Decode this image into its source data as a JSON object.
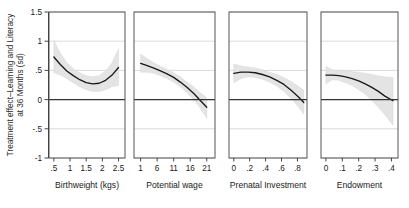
{
  "chart_data": {
    "type": "line",
    "title": "",
    "ylabel_line1": "Treatment effect–Learning and Literacy",
    "ylabel_line2": "at 36 Months (sd)",
    "ylim": [
      -1.0,
      1.5
    ],
    "yticks": [
      1.5,
      1,
      0.5,
      0,
      -0.5,
      -1
    ],
    "ytick_labels": [
      "1.5",
      "1",
      ".5",
      "0",
      "-.5",
      "-1"
    ],
    "grid": true,
    "legend": "none",
    "band_label": "95% confidence interval",
    "band_color": "#e3e3e3",
    "line_color": "#1a1a1a",
    "zero_line_color": "#333333",
    "panels": [
      {
        "xlabel": "Birthweight (kgs)",
        "xticks": [
          0.5,
          1,
          1.5,
          2,
          2.5
        ],
        "xtick_labels": [
          ".5",
          "1",
          "1.5",
          "2",
          "2.5"
        ],
        "xlim": [
          0.35,
          2.7
        ],
        "x": [
          0.5,
          0.7,
          0.9,
          1.1,
          1.3,
          1.5,
          1.7,
          1.9,
          2.1,
          2.3,
          2.5
        ],
        "fit": [
          0.73,
          0.6,
          0.49,
          0.41,
          0.34,
          0.29,
          0.27,
          0.28,
          0.33,
          0.42,
          0.55
        ],
        "lower": [
          0.46,
          0.42,
          0.36,
          0.29,
          0.22,
          0.17,
          0.14,
          0.14,
          0.17,
          0.22,
          0.24
        ],
        "upper": [
          1.01,
          0.8,
          0.63,
          0.53,
          0.46,
          0.41,
          0.39,
          0.41,
          0.49,
          0.63,
          0.87
        ]
      },
      {
        "xlabel": "Potential wage",
        "xticks": [
          1,
          6,
          11,
          16,
          21
        ],
        "xtick_labels": [
          "1",
          "6",
          "11",
          "16",
          "21"
        ],
        "xlim": [
          -1.0,
          23.5
        ],
        "x": [
          1,
          3,
          5,
          7,
          9,
          11,
          13,
          15,
          17,
          19,
          21
        ],
        "fit": [
          0.62,
          0.58,
          0.54,
          0.49,
          0.44,
          0.38,
          0.3,
          0.21,
          0.11,
          -0.01,
          -0.13
        ],
        "lower": [
          0.47,
          0.47,
          0.45,
          0.41,
          0.36,
          0.3,
          0.22,
          0.12,
          0.0,
          -0.14,
          -0.32
        ],
        "upper": [
          0.78,
          0.7,
          0.63,
          0.57,
          0.52,
          0.46,
          0.39,
          0.3,
          0.22,
          0.12,
          0.03
        ]
      },
      {
        "xlabel": "Prenatal Investment",
        "xticks": [
          0,
          0.2,
          0.4,
          0.6,
          0.8
        ],
        "xtick_labels": [
          "0",
          ".2",
          ".4",
          ".6",
          ".8"
        ],
        "xlim": [
          -0.06,
          0.92
        ],
        "x": [
          0,
          0.09,
          0.18,
          0.27,
          0.36,
          0.45,
          0.54,
          0.63,
          0.72,
          0.81,
          0.88
        ],
        "fit": [
          0.45,
          0.47,
          0.47,
          0.46,
          0.43,
          0.39,
          0.33,
          0.26,
          0.16,
          0.05,
          -0.05
        ],
        "lower": [
          0.29,
          0.36,
          0.39,
          0.38,
          0.35,
          0.3,
          0.23,
          0.14,
          0.02,
          -0.12,
          -0.25
        ],
        "upper": [
          0.61,
          0.58,
          0.56,
          0.54,
          0.51,
          0.47,
          0.43,
          0.38,
          0.31,
          0.23,
          0.16
        ]
      },
      {
        "xlabel": "Endowment",
        "xticks": [
          0,
          0.1,
          0.2,
          0.3,
          0.4
        ],
        "xtick_labels": [
          "0",
          ".1",
          ".2",
          ".3",
          ".4"
        ],
        "xlim": [
          -0.03,
          0.44
        ],
        "x": [
          0,
          0.04,
          0.08,
          0.12,
          0.16,
          0.2,
          0.24,
          0.28,
          0.32,
          0.36,
          0.41
        ],
        "fit": [
          0.42,
          0.42,
          0.41,
          0.39,
          0.36,
          0.32,
          0.27,
          0.21,
          0.14,
          0.06,
          -0.02
        ],
        "lower": [
          0.27,
          0.34,
          0.33,
          0.29,
          0.24,
          0.17,
          0.09,
          -0.01,
          -0.13,
          -0.26,
          -0.44
        ],
        "upper": [
          0.57,
          0.51,
          0.5,
          0.49,
          0.48,
          0.47,
          0.45,
          0.43,
          0.41,
          0.39,
          0.38
        ]
      }
    ]
  }
}
